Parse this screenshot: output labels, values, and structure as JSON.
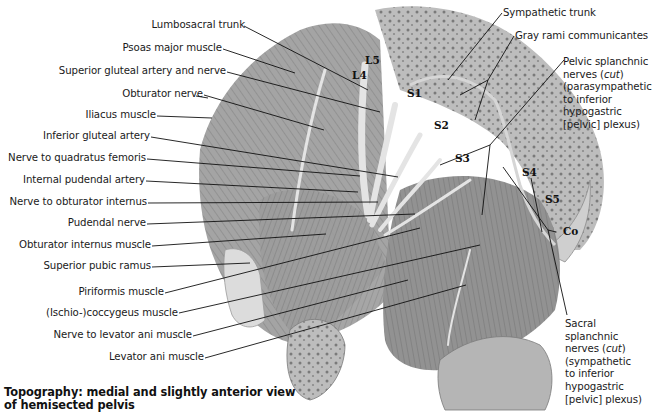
{
  "figure": {
    "caption_line1": "Topography: medial and slightly anterior view",
    "caption_line2": "of hemisected pelvis"
  },
  "left_labels": [
    {
      "id": "lumbosacral-trunk",
      "text": "Lumbosacral trunk"
    },
    {
      "id": "psoas-major-muscle",
      "text": "Psoas major muscle"
    },
    {
      "id": "superior-gluteal-artery-and-nerve",
      "text": "Superior gluteal artery and nerve"
    },
    {
      "id": "obturator-nerve",
      "text": "Obturator nerve"
    },
    {
      "id": "iliacus-muscle",
      "text": "Iliacus muscle"
    },
    {
      "id": "inferior-gluteal-artery",
      "text": "Inferior gluteal artery"
    },
    {
      "id": "nerve-to-quadratus-femoris",
      "text": "Nerve to quadratus femoris"
    },
    {
      "id": "internal-pudendal-artery",
      "text": "Internal pudendal artery"
    },
    {
      "id": "nerve-to-obturator-internus",
      "text": "Nerve to obturator internus"
    },
    {
      "id": "pudendal-nerve",
      "text": "Pudendal nerve"
    },
    {
      "id": "obturator-internus-muscle",
      "text": "Obturator internus muscle"
    },
    {
      "id": "superior-pubic-ramus",
      "text": "Superior pubic ramus"
    },
    {
      "id": "piriformis-muscle",
      "text": "Piriformis muscle"
    },
    {
      "id": "ischio-coccygeus-muscle",
      "text": "(Ischio-)coccygeus muscle"
    },
    {
      "id": "nerve-to-levator-ani-muscle",
      "text": "Nerve to levator ani muscle"
    },
    {
      "id": "levator-ani-muscle",
      "text": "Levator ani muscle"
    }
  ],
  "right_labels": {
    "sympathetic_trunk": "Sympathetic trunk",
    "gray_rami": "Gray rami communicantes",
    "pelvic_splanchnic": {
      "line1": "Pelvic splanchnic",
      "line2_pre": "nerves (",
      "line2_em": "cut",
      "line2_post": ")",
      "line3": "(parasympathetic",
      "line4": "to inferior",
      "line5": "hypogastric",
      "line6": "[pelvic] plexus)"
    },
    "sacral_splanchnic": {
      "line1": "Sacral",
      "line2": "splanchnic",
      "line3_pre": "nerves (",
      "line3_em": "cut",
      "line3_post": ")",
      "line4": "(sympathetic",
      "line5": "to inferior",
      "line6": "hypogastric",
      "line7": "[pelvic] plexus)"
    }
  },
  "vertebral_labels": {
    "L4": "L4",
    "L5": "L5",
    "S1": "S1",
    "S2": "S2",
    "S3": "S3",
    "S4": "S4",
    "S5": "S5",
    "Co": "Co"
  },
  "colors": {
    "background": "#ffffff",
    "text": "#1a1a1a",
    "leader": "#111111",
    "muscle_light": "#c9c9c9",
    "muscle_mid": "#9a9a9a",
    "muscle_dark": "#6e6e6e",
    "bone": "#d8d8d8"
  }
}
